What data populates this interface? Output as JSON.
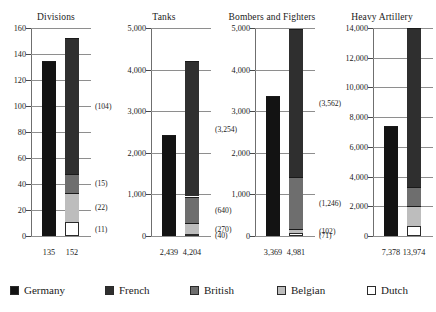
{
  "chart_data": {
    "type": "bar",
    "title": "",
    "subtitle": "",
    "xlabel": "",
    "ylabel": "",
    "grid": true,
    "legend_position": "bottom",
    "stacked": true,
    "orientation": "vertical",
    "series": [
      {
        "name": "Germany",
        "color": "#131313"
      },
      {
        "name": "French",
        "color": "#2f2f2f"
      },
      {
        "name": "British",
        "color": "#6e6e6e"
      },
      {
        "name": "Belgian",
        "color": "#bdbdbd"
      },
      {
        "name": "Dutch",
        "color": "#ffffff"
      }
    ],
    "panels": [
      {
        "title": "Divisions",
        "ylim": [
          0,
          160
        ],
        "yticks": [
          0,
          20,
          40,
          60,
          80,
          100,
          120,
          140,
          160
        ],
        "ytick_labels": [
          "0",
          "20",
          "40",
          "60",
          "80",
          "100",
          "120",
          "140",
          "160"
        ],
        "bars": [
          {
            "name": "Germany",
            "total": 135,
            "total_label": "135",
            "segments": [
              {
                "series": "Germany",
                "value": 135,
                "label": ""
              }
            ]
          },
          {
            "name": "Allies",
            "total": 152,
            "total_label": "152",
            "segments": [
              {
                "series": "Dutch",
                "value": 11,
                "label": "(11)"
              },
              {
                "series": "Belgian",
                "value": 22,
                "label": "(22)"
              },
              {
                "series": "British",
                "value": 15,
                "label": "(15)"
              },
              {
                "series": "French",
                "value": 104,
                "label": "(104)"
              }
            ]
          }
        ]
      },
      {
        "title": "Tanks",
        "ylim": [
          0,
          5000
        ],
        "yticks": [
          0,
          1000,
          2000,
          3000,
          4000,
          5000
        ],
        "ytick_labels": [
          "0",
          "1,000",
          "2,000",
          "3,000",
          "4,000",
          "5,000"
        ],
        "bars": [
          {
            "name": "Germany",
            "total": 2439,
            "total_label": "2,439",
            "segments": [
              {
                "series": "Germany",
                "value": 2439,
                "label": ""
              }
            ]
          },
          {
            "name": "Allies",
            "total": 4204,
            "total_label": "4,204",
            "segments": [
              {
                "series": "Dutch",
                "value": 40,
                "label": "(40)"
              },
              {
                "series": "Belgian",
                "value": 270,
                "label": "(270)"
              },
              {
                "series": "British",
                "value": 640,
                "label": "(640)"
              },
              {
                "series": "French",
                "value": 3254,
                "label": "(3,254)"
              }
            ]
          }
        ]
      },
      {
        "title": "Bombers and Fighters",
        "ylim": [
          0,
          5000
        ],
        "yticks": [
          0,
          1000,
          2000,
          3000,
          4000,
          5000
        ],
        "ytick_labels": [
          "0",
          "1,000",
          "2,000",
          "3,000",
          "4,000",
          "5,000"
        ],
        "bars": [
          {
            "name": "Germany",
            "total": 3369,
            "total_label": "3,369",
            "segments": [
              {
                "series": "Germany",
                "value": 3369,
                "label": ""
              }
            ]
          },
          {
            "name": "Allies",
            "total": 4981,
            "total_label": "4,981",
            "segments": [
              {
                "series": "Dutch",
                "value": 71,
                "label": "(71)"
              },
              {
                "series": "Belgian",
                "value": 102,
                "label": "(102)"
              },
              {
                "series": "British",
                "value": 1246,
                "label": "(1,246)"
              },
              {
                "series": "French",
                "value": 3562,
                "label": "(3,562)"
              }
            ]
          }
        ]
      },
      {
        "title": "Heavy Artillery",
        "ylim": [
          0,
          14000
        ],
        "yticks": [
          0,
          2000,
          4000,
          6000,
          8000,
          10000,
          12000,
          14000
        ],
        "ytick_labels": [
          "0",
          "2,000",
          "4,000",
          "6,000",
          "8,000",
          "10,000",
          "12,000",
          "14,000"
        ],
        "bars": [
          {
            "name": "Germany",
            "total": 7378,
            "total_label": "7,378",
            "segments": [
              {
                "series": "Germany",
                "value": 7378,
                "label": ""
              }
            ]
          },
          {
            "name": "Allies",
            "total": 13974,
            "total_label": "13,974",
            "segments": [
              {
                "series": "Dutch",
                "value": 656,
                "label": "(656)"
              },
              {
                "series": "Belgian",
                "value": 1338,
                "label": "(1,338)"
              },
              {
                "series": "British",
                "value": 1280,
                "label": "(1,280)"
              },
              {
                "series": "French",
                "value": 10700,
                "label": "(10,700)"
              }
            ]
          }
        ]
      }
    ]
  },
  "legend": {
    "items": [
      {
        "label": "Germany",
        "color": "#131313"
      },
      {
        "label": "French",
        "color": "#2f2f2f"
      },
      {
        "label": "British",
        "color": "#6e6e6e"
      },
      {
        "label": "Belgian",
        "color": "#bdbdbd"
      },
      {
        "label": "Dutch",
        "color": "#ffffff"
      }
    ]
  }
}
